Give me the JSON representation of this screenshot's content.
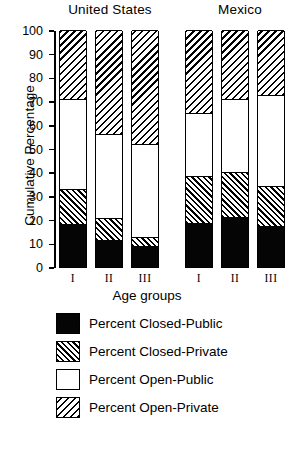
{
  "chart_data": {
    "type": "bar",
    "subtype": "stacked-bar",
    "title": "",
    "xlabel": "Age groups",
    "ylabel": "Cumulative Percentage",
    "ylim": [
      0,
      100
    ],
    "yticks": [
      0,
      10,
      20,
      30,
      40,
      50,
      60,
      70,
      80,
      90,
      100
    ],
    "grid": false,
    "legend_position": "below",
    "group_labels": [
      "United States",
      "Mexico"
    ],
    "categories": [
      "I",
      "II",
      "III",
      "I",
      "II",
      "III"
    ],
    "category_groups": [
      "United States",
      "United States",
      "United States",
      "Mexico",
      "Mexico",
      "Mexico"
    ],
    "series": [
      {
        "name": "Percent Closed-Public",
        "fill": "solid-black",
        "color": "#000000",
        "values": [
          18,
          11.5,
          9,
          18.5,
          21,
          17.5
        ]
      },
      {
        "name": "Percent Closed-Private",
        "fill": "hatch-forward-dense",
        "color": "#000000",
        "values": [
          15,
          9,
          3.5,
          20,
          19,
          16.5
        ]
      },
      {
        "name": "Percent Open-Public",
        "fill": "white",
        "color": "#ffffff",
        "values": [
          38,
          35.5,
          39.5,
          26.5,
          31,
          38.5
        ]
      },
      {
        "name": "Percent Open-Private",
        "fill": "hatch-backward",
        "color": "#000000",
        "values": [
          29,
          44,
          48,
          35,
          29,
          27.5
        ]
      }
    ],
    "cumulative_tops": {
      "closed_public": [
        18,
        11.5,
        9,
        18.5,
        21,
        17.5
      ],
      "closed_private": [
        33,
        20.5,
        12.5,
        38.5,
        40,
        34
      ],
      "open_public": [
        71,
        56,
        52,
        65,
        71,
        72.5
      ],
      "open_private": [
        100,
        100,
        100,
        100,
        100,
        100
      ]
    }
  },
  "axis": {
    "y_title": "Cumulative Percentage",
    "x_title": "Age groups",
    "y_ticks": [
      "100",
      "90",
      "80",
      "70",
      "60",
      "50",
      "40",
      "30",
      "20",
      "10",
      "0"
    ]
  },
  "groups": [
    {
      "label": "United States"
    },
    {
      "label": "Mexico"
    }
  ],
  "x_ticks": [
    {
      "label": "I"
    },
    {
      "label": "II"
    },
    {
      "label": "III"
    },
    {
      "label": "I"
    },
    {
      "label": "II"
    },
    {
      "label": "III"
    }
  ],
  "legend": {
    "items": [
      {
        "label": "Percent Closed-Public",
        "swatch": "solid-black-swatch"
      },
      {
        "label": "Percent Closed-Private",
        "swatch": "hatch-forward-swatch"
      },
      {
        "label": "Percent Open-Public",
        "swatch": "white-swatch"
      },
      {
        "label": "Percent Open-Private",
        "swatch": "hatch-backward-swatch"
      }
    ]
  }
}
